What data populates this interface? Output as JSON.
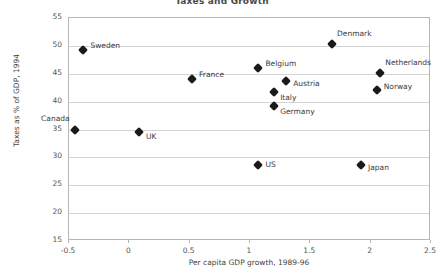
{
  "chart_data": {
    "type": "scatter",
    "title": "Taxes and Growth",
    "xlabel": "Per capita GDP growth, 1989-96",
    "ylabel": "Taxes as % of GDP, 1994",
    "xlim": [
      -0.5,
      2.5
    ],
    "ylim": [
      15,
      55
    ],
    "xticks": [
      "-0.5",
      "0",
      "0.5",
      "1",
      "1.5",
      "2",
      "2.5"
    ],
    "xtick_values": [
      -0.5,
      0,
      0.5,
      1,
      1.5,
      2,
      2.5
    ],
    "yticks": [
      "15",
      "20",
      "25",
      "30",
      "35",
      "40",
      "45",
      "50",
      "55"
    ],
    "ytick_values": [
      15,
      20,
      25,
      30,
      35,
      40,
      45,
      50,
      55
    ],
    "grid": "horizontal",
    "legend": "none",
    "marker": "diamond",
    "marker_color": "#1a1a1a",
    "points": [
      {
        "label": "Canada",
        "x": -0.45,
        "y": 35.0,
        "label_dx": -34,
        "label_dy": -11
      },
      {
        "label": "Sweden",
        "x": -0.38,
        "y": 49.2,
        "label_dx": 7,
        "label_dy": -4
      },
      {
        "label": "UK",
        "x": 0.08,
        "y": 34.5,
        "label_dx": 7,
        "label_dy": 5
      },
      {
        "label": "France",
        "x": 0.52,
        "y": 44.1,
        "label_dx": 7,
        "label_dy": -4
      },
      {
        "label": "Belgium",
        "x": 1.07,
        "y": 46.1,
        "label_dx": 7,
        "label_dy": -4
      },
      {
        "label": "US",
        "x": 1.07,
        "y": 28.6,
        "label_dx": 7,
        "label_dy": 0
      },
      {
        "label": "Italy",
        "x": 1.2,
        "y": 41.8,
        "label_dx": 6,
        "label_dy": 6
      },
      {
        "label": "Germany",
        "x": 1.2,
        "y": 39.3,
        "label_dx": 6,
        "label_dy": 6
      },
      {
        "label": "Austria",
        "x": 1.3,
        "y": 43.7,
        "label_dx": 7,
        "label_dy": 3
      },
      {
        "label": "Denmark",
        "x": 1.68,
        "y": 50.3,
        "label_dx": 5,
        "label_dy": -10
      },
      {
        "label": "Japan",
        "x": 1.92,
        "y": 28.6,
        "label_dx": 7,
        "label_dy": 3
      },
      {
        "label": "Netherlands",
        "x": 2.08,
        "y": 45.2,
        "label_dx": 5,
        "label_dy": -10
      },
      {
        "label": "Norway",
        "x": 2.05,
        "y": 42.0,
        "label_dx": 7,
        "label_dy": -3
      }
    ]
  }
}
